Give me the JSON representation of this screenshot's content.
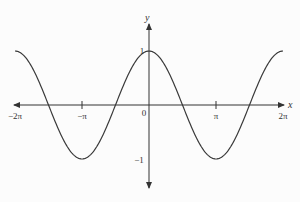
{
  "chart_data": {
    "type": "line",
    "title": "",
    "xlabel": "x",
    "ylabel": "y",
    "function": "cos(x)",
    "xlim": [
      "-2π",
      "2π"
    ],
    "ylim": [
      -1,
      1
    ],
    "grid": false,
    "legend": null,
    "x_ticks": [
      {
        "value": -6.2832,
        "label": "−2π"
      },
      {
        "value": -3.1416,
        "label": "−π"
      },
      {
        "value": 0,
        "label": "0"
      },
      {
        "value": 3.1416,
        "label": "π"
      },
      {
        "value": 6.2832,
        "label": "2π"
      }
    ],
    "y_ticks": [
      {
        "value": 1,
        "label": "1"
      },
      {
        "value": -1,
        "label": "−1"
      }
    ],
    "series": [
      {
        "name": "y = cos x",
        "x": [
          -6.2832,
          -4.7124,
          -3.1416,
          -1.5708,
          0,
          1.5708,
          3.1416,
          4.7124,
          6.2832
        ],
        "y": [
          1,
          0,
          -1,
          0,
          1,
          0,
          -1,
          0,
          1
        ]
      }
    ]
  },
  "labels": {
    "x_axis": "x",
    "y_axis": "y",
    "tick_neg2pi": "−2π",
    "tick_negpi": "−π",
    "tick_zero": "0",
    "tick_pi": "π",
    "tick_2pi": "2π",
    "tick_one": "1",
    "tick_neg_one": "−1"
  },
  "colors": {
    "axis": "#333333",
    "curve": "#3a3a3a",
    "background": "#fcfcfc"
  }
}
